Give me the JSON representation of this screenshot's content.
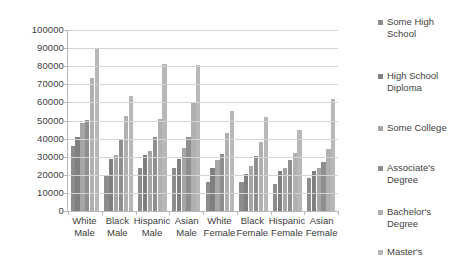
{
  "chart_data": {
    "type": "bar",
    "title": "",
    "subtitle": "",
    "xlabel": "",
    "ylabel": "",
    "ylim": [
      0,
      100000
    ],
    "ytick_step": 10000,
    "yticks": [
      "0",
      "10000",
      "20000",
      "30000",
      "40000",
      "50000",
      "60000",
      "70000",
      "80000",
      "90000",
      "100000"
    ],
    "grid": true,
    "legend_position": "right",
    "categories": [
      "White Male",
      "Black Male",
      "Hispanic Male",
      "Asian Male",
      "White Female",
      "Black Female",
      "Hispanic Female",
      "Asian Female"
    ],
    "series": [
      {
        "name": "Some High School",
        "color": "#8c8c8c",
        "values": [
          36000,
          20000,
          24000,
          24000,
          16000,
          16000,
          15000,
          18000
        ]
      },
      {
        "name": "High School Diploma",
        "color": "#7f7f7f",
        "values": [
          41000,
          29000,
          31000,
          29000,
          23500,
          20500,
          22000,
          22000
        ]
      },
      {
        "name": "Some College",
        "color": "#a6a6a6",
        "values": [
          48500,
          31000,
          33000,
          35000,
          28000,
          25000,
          24000,
          24000
        ]
      },
      {
        "name": "Associate's Degree",
        "color": "#8f8f8f",
        "values": [
          50500,
          39000,
          41000,
          41000,
          31500,
          30500,
          28000,
          27000
        ]
      },
      {
        "name": "Bachelor's Degree",
        "color": "#b0b0b0",
        "values": [
          73500,
          52500,
          51000,
          60500,
          43000,
          38000,
          32000,
          34500
        ]
      },
      {
        "name": "Master's",
        "color": "#b8b8b8",
        "values": [
          90000,
          63500,
          81000,
          80500,
          55000,
          52000,
          44500,
          62000
        ]
      }
    ]
  },
  "legend": {
    "items": [
      {
        "label": "Some High\nSchool",
        "color": "#8c8c8c"
      },
      {
        "label": "High School\nDiploma",
        "color": "#7f7f7f"
      },
      {
        "label": "Some College",
        "color": "#a6a6a6"
      },
      {
        "label": "Associate's\nDegree",
        "color": "#8f8f8f"
      },
      {
        "label": "Bachelor's\nDegree",
        "color": "#b0b0b0"
      },
      {
        "label": "Master's",
        "color": "#b8b8b8"
      }
    ]
  }
}
